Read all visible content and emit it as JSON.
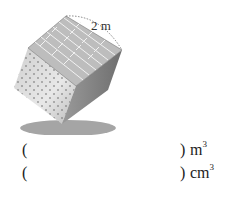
{
  "figure": {
    "type": "cube",
    "side_label": "2 m",
    "colors": {
      "top_face": "#bdbdbd",
      "top_lines": "#ffffff",
      "left_face": "#d6d6d6",
      "right_face": "#8a8a8a",
      "shadow": "#9a9a9a",
      "dash": "#666666"
    }
  },
  "answers": [
    {
      "open": "(",
      "close": ")",
      "unit_base": "m",
      "unit_exp": "3"
    },
    {
      "open": "(",
      "close": ")",
      "unit_base": "cm",
      "unit_exp": "3"
    }
  ]
}
